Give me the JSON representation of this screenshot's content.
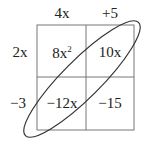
{
  "diagram": {
    "type": "area-model-box",
    "column_headers": [
      "4x",
      "+5"
    ],
    "row_headers": [
      "2x",
      "−3"
    ],
    "cells": [
      [
        {
          "base": "8x",
          "exp": "2"
        },
        {
          "base": "10x",
          "exp": ""
        }
      ],
      [
        {
          "base": "−12x",
          "exp": ""
        },
        {
          "base": "−15",
          "exp": ""
        }
      ]
    ],
    "annotation": "ellipse-around-anti-diagonal-cells",
    "colors": {
      "line": "#555555",
      "text": "#222222"
    }
  }
}
